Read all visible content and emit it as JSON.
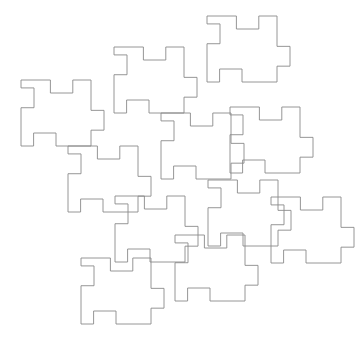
{
  "figure": {
    "type": "geometric-tiling",
    "canvas": {
      "width": 359,
      "height": 345,
      "background_color": "#ffffff"
    },
    "style": {
      "stroke_color": "#8a8a8a",
      "stroke_width": 0.9,
      "fill": "none"
    },
    "tile": {
      "label": "jigsaw-square",
      "width": 70,
      "height": 66,
      "tab_depth": 13,
      "edges": [
        {
          "side": "top",
          "direction": "inward",
          "start_fraction": 0.42,
          "length_fraction": 0.32
        },
        {
          "side": "right",
          "direction": "outward",
          "start_fraction": 0.46,
          "length_fraction": 0.3
        },
        {
          "side": "bottom",
          "direction": "inward",
          "start_fraction": 0.18,
          "length_fraction": 0.32
        },
        {
          "side": "left",
          "direction": "inward",
          "start_fraction": 0.12,
          "length_fraction": 0.3
        }
      ]
    },
    "tiles": [
      {
        "name": "tile-left-upper",
        "x": 21,
        "y": 80
      },
      {
        "name": "tile-top-middle",
        "x": 114,
        "y": 47
      },
      {
        "name": "tile-top-right",
        "x": 207,
        "y": 16
      },
      {
        "name": "tile-mid-left",
        "x": 68,
        "y": 146
      },
      {
        "name": "tile-center",
        "x": 161,
        "y": 113
      },
      {
        "name": "tile-right-upper",
        "x": 230,
        "y": 107
      },
      {
        "name": "tile-mid-center",
        "x": 115,
        "y": 196
      },
      {
        "name": "tile-mid-right",
        "x": 208,
        "y": 180
      },
      {
        "name": "tile-bottom-left",
        "x": 81,
        "y": 258
      },
      {
        "name": "tile-bottom-center",
        "x": 175,
        "y": 235
      },
      {
        "name": "tile-bottom-right",
        "x": 271,
        "y": 197
      }
    ]
  }
}
